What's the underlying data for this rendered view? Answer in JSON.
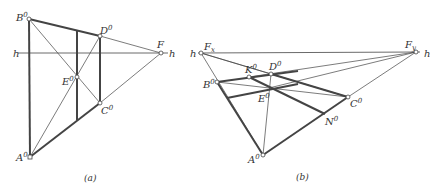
{
  "figure_a": {
    "label": "(a)",
    "horizon_label_left": "h",
    "horizon_label_right": "h",
    "points": {
      "B": {
        "label": "B",
        "sup": "0",
        "x": 29,
        "y": 19
      },
      "D": {
        "label": "D",
        "sup": "0",
        "x": 100,
        "y": 36
      },
      "F": {
        "label": "F",
        "sup": "",
        "x": 161,
        "y": 53
      },
      "E": {
        "label": "E",
        "sup": "0",
        "x": 77,
        "y": 77
      },
      "C": {
        "label": "C",
        "sup": "0",
        "x": 100,
        "y": 103
      },
      "A": {
        "label": "A",
        "sup": "0",
        "x": 30,
        "y": 157
      }
    }
  },
  "figure_b": {
    "label": "(b)",
    "horizon_label_left": "h",
    "horizon_label_right": "h",
    "points": {
      "Fx": {
        "label": "F",
        "sub": "x",
        "x": 201,
        "y": 53
      },
      "Fy": {
        "label": "F",
        "sub": "y",
        "x": 416,
        "y": 52
      },
      "K": {
        "label": "K",
        "sup": "0",
        "x": 249,
        "y": 77
      },
      "D": {
        "label": "D",
        "sup": "0",
        "x": 271,
        "y": 74
      },
      "B": {
        "label": "B",
        "sup": "0",
        "x": 217,
        "y": 82
      },
      "E": {
        "label": "E",
        "sup": "0",
        "x": 269,
        "y": 88
      },
      "C": {
        "label": "C",
        "sup": "0",
        "x": 348,
        "y": 97
      },
      "N": {
        "label": "N",
        "sup": "0",
        "x": 325,
        "y": 114
      },
      "A": {
        "label": "A",
        "sup": "0",
        "x": 263,
        "y": 155
      }
    }
  },
  "caption": ""
}
